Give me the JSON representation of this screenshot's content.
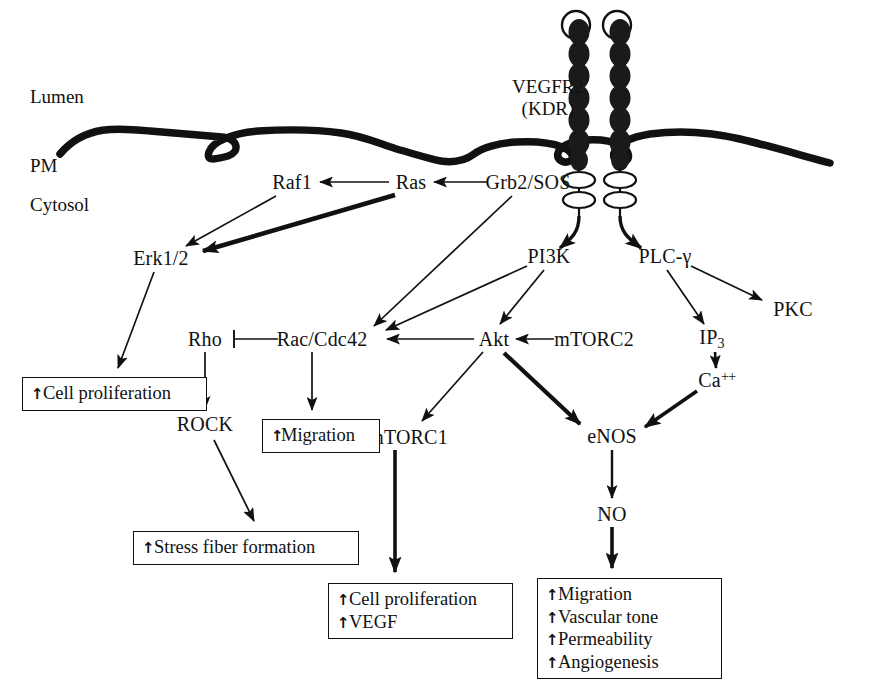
{
  "diagram": {
    "compartments": [
      {
        "id": "lumen",
        "label": "Lumen",
        "x": 30,
        "y": 97
      },
      {
        "id": "pm",
        "label": "PM",
        "x": 30,
        "y": 166
      },
      {
        "id": "cytosol",
        "label": "Cytosol",
        "x": 30,
        "y": 205
      }
    ],
    "receptor": {
      "name_line1": "VEGFR2",
      "name_line2": "(KDR)",
      "label_x": 548,
      "label_y": 85,
      "domain_count": 7,
      "chains": 2
    },
    "nodes": [
      {
        "id": "raf1",
        "label": "Raf1",
        "x": 292,
        "y": 182
      },
      {
        "id": "ras",
        "label": "Ras",
        "x": 411,
        "y": 182
      },
      {
        "id": "grb2sos",
        "label": "Grb2/SOS",
        "x": 528,
        "y": 182
      },
      {
        "id": "erk12",
        "label": "Erk1/2",
        "x": 161,
        "y": 258
      },
      {
        "id": "pi3k",
        "label": "PI3K",
        "x": 549,
        "y": 256
      },
      {
        "id": "plcg",
        "label": "PLC-γ",
        "x": 665,
        "y": 256
      },
      {
        "id": "pkc",
        "label": "PKC",
        "x": 793,
        "y": 309
      },
      {
        "id": "rho",
        "label": "Rho",
        "x": 205,
        "y": 339
      },
      {
        "id": "raccdc42",
        "label": "Rac/Cdc42",
        "x": 322,
        "y": 339
      },
      {
        "id": "akt",
        "label": "Akt",
        "x": 494,
        "y": 339
      },
      {
        "id": "mtorc2",
        "label": "mTORC2",
        "x": 594,
        "y": 339
      },
      {
        "id": "ip3",
        "label": "IP3",
        "x": 712,
        "y": 339
      },
      {
        "id": "ca",
        "label": "Ca++",
        "x": 717,
        "y": 380
      },
      {
        "id": "rock",
        "label": "ROCK",
        "x": 205,
        "y": 424
      },
      {
        "id": "mtorc1",
        "label": "mTORC1",
        "x": 408,
        "y": 437
      },
      {
        "id": "enos",
        "label": "eNOS",
        "x": 612,
        "y": 436
      },
      {
        "id": "no",
        "label": "NO",
        "x": 612,
        "y": 514
      }
    ],
    "outcome_boxes": [
      {
        "id": "cell-proliferation-box",
        "x": 22,
        "y": 377,
        "w": 166,
        "lines": [
          "Cell proliferation"
        ]
      },
      {
        "id": "migration-box",
        "x": 262,
        "y": 419,
        "w": 99,
        "tight": true,
        "lines": [
          "Migration"
        ]
      },
      {
        "id": "stress-fiber-box",
        "x": 133,
        "y": 531,
        "w": 207,
        "lines": [
          "Stress fiber formation"
        ]
      },
      {
        "id": "proliferation-vegf-box",
        "x": 328,
        "y": 583,
        "w": 166,
        "lines": [
          "Cell proliferation",
          "VEGF"
        ]
      },
      {
        "id": "no-outcomes-box",
        "x": 537,
        "y": 578,
        "w": 166,
        "lines": [
          "Migration",
          "Vascular tone",
          "Permeability",
          "Angiogenesis"
        ]
      }
    ],
    "edges": [
      {
        "id": "ras-to-raf1",
        "from": "Ras",
        "to": "Raf1",
        "kind": "arrow-thin"
      },
      {
        "id": "grb2sos-to-ras",
        "from": "Grb2/SOS",
        "to": "Ras",
        "kind": "arrow-thin"
      },
      {
        "id": "raf1-to-erk12",
        "from": "Raf1",
        "to": "Erk1/2",
        "kind": "arrow-thin"
      },
      {
        "id": "ras-to-erk12",
        "from": "Ras",
        "to": "Erk1/2",
        "kind": "arrow-thick"
      },
      {
        "id": "erk12-to-prolif",
        "from": "Erk1/2",
        "to": "Cell proliferation",
        "kind": "arrow-thin"
      },
      {
        "id": "receptor-to-pi3k",
        "from": "VEGFR2",
        "to": "PI3K",
        "kind": "arrow-thick-curve"
      },
      {
        "id": "receptor-to-plcg",
        "from": "VEGFR2",
        "to": "PLC-γ",
        "kind": "arrow-thick-curve"
      },
      {
        "id": "grb2sos-to-rac",
        "from": "Grb2/SOS",
        "to": "Rac/Cdc42",
        "kind": "arrow-thin"
      },
      {
        "id": "pi3k-to-rac",
        "from": "PI3K",
        "to": "Rac/Cdc42",
        "kind": "arrow-thin"
      },
      {
        "id": "pi3k-to-akt",
        "from": "PI3K",
        "to": "Akt",
        "kind": "arrow-thin"
      },
      {
        "id": "plcg-to-ip3",
        "from": "PLC-γ",
        "to": "IP3",
        "kind": "arrow-thin"
      },
      {
        "id": "plcg-to-pkc",
        "from": "PLC-γ",
        "to": "PKC",
        "kind": "arrow-thin"
      },
      {
        "id": "ip3-to-ca",
        "from": "IP3",
        "to": "Ca++",
        "kind": "arrow-thin"
      },
      {
        "id": "ca-to-enos",
        "from": "Ca++",
        "to": "eNOS",
        "kind": "arrow-thick"
      },
      {
        "id": "mtorc2-to-akt",
        "from": "mTORC2",
        "to": "Akt",
        "kind": "arrow-thin"
      },
      {
        "id": "akt-to-rac",
        "from": "Akt",
        "to": "Rac/Cdc42",
        "kind": "arrow-thin"
      },
      {
        "id": "akt-to-mtorc1",
        "from": "Akt",
        "to": "mTORC1",
        "kind": "arrow-thin"
      },
      {
        "id": "akt-to-enos",
        "from": "Akt",
        "to": "eNOS",
        "kind": "arrow-thick"
      },
      {
        "id": "rho-inhibits-rac",
        "from": "Rho",
        "to": "Rac/Cdc42",
        "kind": "inhibition"
      },
      {
        "id": "rho-to-rock",
        "from": "Rho",
        "to": "ROCK",
        "kind": "arrow-thin"
      },
      {
        "id": "rock-to-stress",
        "from": "ROCK",
        "to": "Stress fiber formation",
        "kind": "arrow-thin"
      },
      {
        "id": "rac-to-migration",
        "from": "Rac/Cdc42",
        "to": "Migration",
        "kind": "arrow-thin"
      },
      {
        "id": "mtorc1-to-prolif",
        "from": "mTORC1",
        "to": "Cell proliferation / VEGF",
        "kind": "arrow-thick"
      },
      {
        "id": "enos-to-no",
        "from": "eNOS",
        "to": "NO",
        "kind": "arrow-thin"
      },
      {
        "id": "no-to-outcomes",
        "from": "NO",
        "to": "NO outcomes",
        "kind": "arrow-thick"
      }
    ],
    "colors": {
      "ink": "#111111",
      "background": "#ffffff",
      "receptor_domain": "#1a1a1a"
    }
  }
}
